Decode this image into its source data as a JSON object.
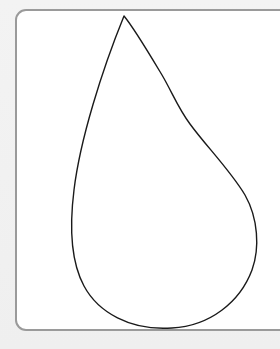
{
  "canvas": {
    "width": 280,
    "height": 349,
    "background_color": "#f1f1f1"
  },
  "card": {
    "background_color": "#ffffff",
    "border_color": "#9a9a9a"
  },
  "shape": {
    "type": "teardrop-outline",
    "stroke_color": "#1a1a1a",
    "fill_color": "none",
    "stroke_width": 1.4
  }
}
